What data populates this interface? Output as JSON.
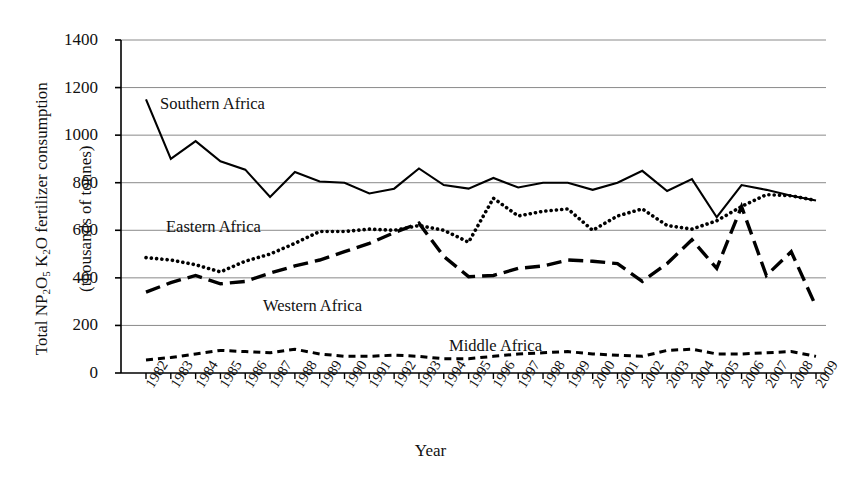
{
  "chart_data": {
    "type": "line",
    "title": "",
    "xlabel": "Year",
    "ylabel": "Total NP2O5 K2O fertilizer consumption (thousands of tonnes)",
    "ylabel_parts": {
      "prefix": "Total NP",
      "sub1": "2",
      "mid1": "O",
      "sub2": "5",
      "mid2": " K",
      "sub3": "2",
      "mid3": "O",
      "suffix": " fertilizer consumption",
      "line2": "(thousands of tonnes)"
    },
    "ylim": [
      0,
      1400
    ],
    "yticks": [
      0,
      200,
      400,
      600,
      800,
      1000,
      1200,
      1400
    ],
    "ytick_labels": [
      "0",
      "200",
      "400",
      "600",
      "800",
      "1000",
      "1200",
      "1400"
    ],
    "grid": true,
    "legend_position": "inline-annotations",
    "categories": [
      "1982",
      "1983",
      "1984",
      "1985",
      "1986",
      "1987",
      "1988",
      "1989",
      "1990",
      "1991",
      "1992",
      "1993",
      "1994",
      "1995",
      "1996",
      "1997",
      "1998",
      "1999",
      "2000",
      "2001",
      "2002",
      "2003",
      "2004",
      "2005",
      "2006",
      "2007",
      "2008",
      "2009"
    ],
    "series": [
      {
        "name": "Southern Africa",
        "style": "solid",
        "color": "#000000",
        "values": [
          1150,
          900,
          975,
          890,
          855,
          740,
          845,
          805,
          800,
          755,
          775,
          860,
          790,
          775,
          820,
          780,
          800,
          800,
          770,
          800,
          850,
          765,
          815,
          655,
          790,
          770,
          745,
          725
        ]
      },
      {
        "name": "Eastern Africa",
        "style": "dotted",
        "color": "#000000",
        "values": [
          485,
          475,
          455,
          425,
          470,
          500,
          545,
          595,
          595,
          605,
          600,
          620,
          600,
          550,
          735,
          660,
          680,
          690,
          600,
          660,
          690,
          620,
          605,
          640,
          700,
          750,
          745,
          725
        ]
      },
      {
        "name": "Western Africa",
        "style": "dashed-long",
        "color": "#000000",
        "values": [
          340,
          380,
          410,
          375,
          385,
          420,
          450,
          475,
          510,
          545,
          590,
          630,
          490,
          405,
          410,
          440,
          450,
          475,
          470,
          460,
          385,
          460,
          560,
          440,
          700,
          410,
          510,
          280
        ]
      },
      {
        "name": "Middle Africa",
        "style": "dashed-short",
        "color": "#000000",
        "values": [
          55,
          65,
          80,
          95,
          90,
          85,
          100,
          80,
          70,
          70,
          75,
          70,
          60,
          60,
          70,
          80,
          85,
          90,
          80,
          75,
          70,
          95,
          100,
          80,
          80,
          85,
          90,
          70
        ]
      }
    ],
    "annotations": [
      {
        "label": "Southern Africa",
        "x_px": 160,
        "y_px": 94
      },
      {
        "label": "Eastern Africa",
        "x_px": 166,
        "y_px": 217
      },
      {
        "label": "Western Africa",
        "x_px": 263,
        "y_px": 296
      },
      {
        "label": "Middle Africa",
        "x_px": 449,
        "y_px": 336
      }
    ]
  }
}
